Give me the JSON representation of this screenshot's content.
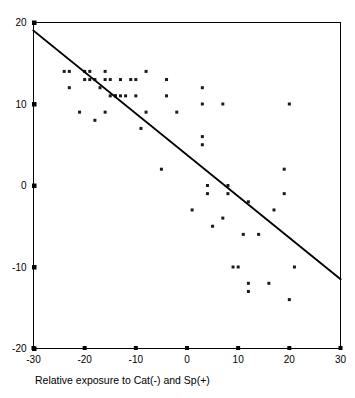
{
  "chart_data": {
    "type": "scatter",
    "title": "",
    "subtitle": "",
    "xlabel": "Relative exposure to Cat(-) and Sp(+)",
    "ylabel": "",
    "xlim": [
      -30,
      30
    ],
    "ylim": [
      -20,
      20
    ],
    "xticks": [
      -30,
      -20,
      -10,
      0,
      10,
      20,
      30
    ],
    "yticks": [
      -20,
      -10,
      0,
      10,
      20
    ],
    "xtick_labels": [
      "-30",
      "-20",
      "-10",
      "0",
      "10",
      "20",
      "30"
    ],
    "ytick_labels": [
      "-20",
      "-10",
      "0",
      "10",
      "20"
    ],
    "grid": false,
    "legend": null,
    "marker": "square",
    "marker_color": "#1a1a1a",
    "marker_size": 3,
    "points": [
      [
        -24,
        14
      ],
      [
        -23,
        14
      ],
      [
        -23,
        12
      ],
      [
        -21,
        9
      ],
      [
        -20,
        14
      ],
      [
        -20,
        13
      ],
      [
        -19,
        14
      ],
      [
        -19,
        13
      ],
      [
        -18,
        8
      ],
      [
        -18,
        13
      ],
      [
        -17,
        12
      ],
      [
        -16,
        14
      ],
      [
        -16,
        9
      ],
      [
        -16,
        13
      ],
      [
        -15,
        11
      ],
      [
        -15,
        13
      ],
      [
        -14,
        11
      ],
      [
        -14,
        11
      ],
      [
        -13,
        11
      ],
      [
        -13,
        13
      ],
      [
        -12,
        11
      ],
      [
        -11,
        13
      ],
      [
        -10,
        13
      ],
      [
        -10,
        11
      ],
      [
        -9,
        7
      ],
      [
        -8,
        14
      ],
      [
        -8,
        9
      ],
      [
        -5,
        2
      ],
      [
        -4,
        13
      ],
      [
        -4,
        11
      ],
      [
        -2,
        9
      ],
      [
        1,
        -3
      ],
      [
        3,
        12
      ],
      [
        3,
        10
      ],
      [
        3,
        6
      ],
      [
        3,
        5
      ],
      [
        4,
        0
      ],
      [
        4,
        -1
      ],
      [
        5,
        -5
      ],
      [
        7,
        10
      ],
      [
        7,
        -4
      ],
      [
        8,
        0
      ],
      [
        8,
        -1
      ],
      [
        9,
        -10
      ],
      [
        10,
        -10
      ],
      [
        11,
        -6
      ],
      [
        12,
        -2
      ],
      [
        12,
        -12
      ],
      [
        12,
        -13
      ],
      [
        14,
        -6
      ],
      [
        16,
        -12
      ],
      [
        17,
        -3
      ],
      [
        19,
        2
      ],
      [
        19,
        -1
      ],
      [
        20,
        10
      ],
      [
        21,
        -10
      ],
      [
        20,
        -14
      ]
    ],
    "fit_line": {
      "type": "linear",
      "x_start": -30,
      "y_start": 19,
      "x_end": 30,
      "y_end": -11.5,
      "slope": -0.508,
      "intercept": 3.75
    }
  },
  "axes": {
    "y_axis_name": "vertical-axis",
    "x_axis_name": "horizontal-axis"
  }
}
